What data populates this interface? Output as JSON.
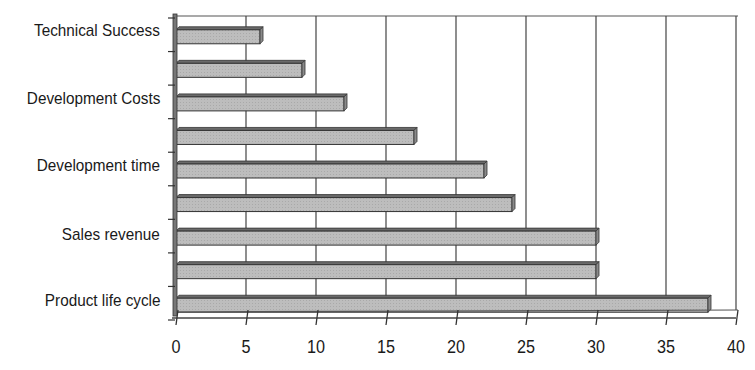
{
  "chart_data": {
    "type": "bar",
    "orientation": "horizontal",
    "title": "",
    "xlabel": "",
    "ylabel": "",
    "categories": [
      "Technical Success",
      "",
      "Development Costs",
      "",
      "Development time",
      "",
      "Sales revenue",
      "",
      "Product life cycle"
    ],
    "values": [
      6,
      9,
      12,
      17,
      22,
      24,
      30,
      30,
      38
    ],
    "xlim": [
      0,
      40
    ],
    "xticks": [
      0,
      5,
      10,
      15,
      20,
      25,
      30,
      35,
      40
    ],
    "grid": "vertical",
    "legend": null,
    "style": "3d-bar",
    "bar_color": "#b8b8b8",
    "edge_color": "#3a3a3a"
  },
  "labels": {
    "cat0": "Technical Success",
    "cat2": "Development Costs",
    "cat4": "Development time",
    "cat6": "Sales revenue",
    "cat8": "Product life cycle"
  },
  "ticks": [
    "0",
    "5",
    "10",
    "15",
    "20",
    "25",
    "30",
    "35",
    "40"
  ]
}
